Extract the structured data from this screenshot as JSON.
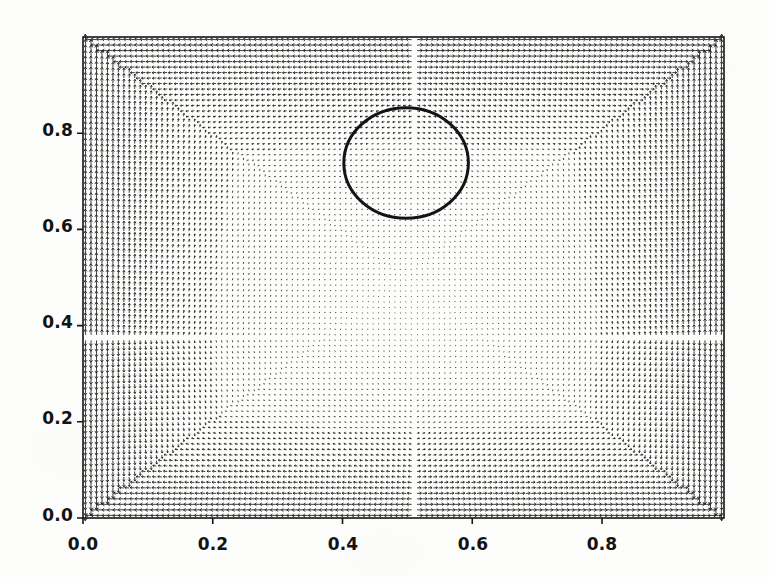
{
  "figure": {
    "kind": "quiver-vector-field-plot",
    "width": 769,
    "height": 577,
    "background_color": "#fdfdfc",
    "axes_color": "#151515",
    "arrow_color": "#1a1a1a",
    "contour_color": "#141414",
    "plot_box": {
      "left": 83,
      "top": 37,
      "right": 724,
      "bottom": 518
    }
  },
  "chart_data": {
    "type": "scatter",
    "subtype": "quiver",
    "title": "",
    "subtitle": "",
    "xlabel": "",
    "ylabel": "",
    "xlim": [
      0.0,
      0.988
    ],
    "ylim": [
      0.0,
      1.0
    ],
    "grid": false,
    "legend": null,
    "x_ticks": [
      0.0,
      0.2,
      0.4,
      0.6,
      0.8
    ],
    "y_ticks": [
      0.0,
      0.2,
      0.4,
      0.6,
      0.8
    ],
    "x_tick_labels": [
      "0.0",
      "0.2",
      "0.4",
      "0.6",
      "0.8"
    ],
    "y_tick_labels": [
      "0.0",
      "0.2",
      "0.4",
      "0.6",
      "0.8"
    ],
    "tick_direction": "out",
    "frame": "full-box",
    "vector_field": {
      "grid_nx": 118,
      "grid_ny": 88,
      "arrow_max_length_px": 5.0,
      "arrow_head": "barbed",
      "magnitude_description": "largest near all four domain boundaries, decaying to near zero toward the interior",
      "magnitude_min": 0.0,
      "magnitude_max": 1.0,
      "interior_minimum_center": [
        0.52,
        0.38
      ],
      "dominant_direction": "mostly vertical near left and right walls, mostly horizontal near top and bottom walls"
    },
    "annotations": [
      {
        "kind": "circle-outline",
        "center_x": 0.498,
        "center_y": 0.738,
        "radius_x": 0.096,
        "radius_y": 0.115,
        "stroke_width_px": 3,
        "filled": false
      }
    ]
  },
  "axes": {
    "x_tick_labels": [
      "0.0",
      "0.2",
      "0.4",
      "0.6",
      "0.8"
    ],
    "y_tick_labels": [
      "0.0",
      "0.2",
      "0.4",
      "0.6",
      "0.8"
    ]
  }
}
